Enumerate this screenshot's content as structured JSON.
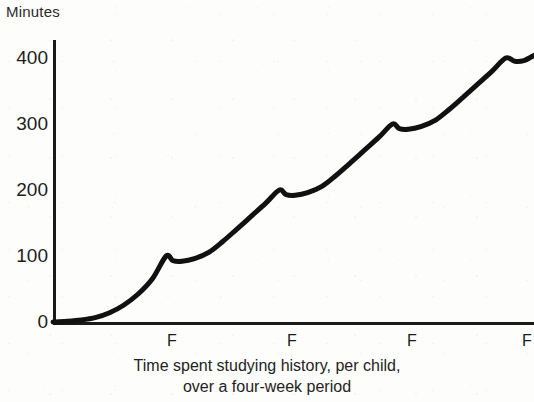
{
  "chart_data": {
    "type": "line",
    "title": "",
    "caption_line_1": "Time spent studying history, per child,",
    "caption_line_2": "over a four-week period",
    "ylabel": "Minutes",
    "xlabel": "",
    "yticks": [
      0,
      100,
      200,
      300,
      400
    ],
    "ytick_labels": [
      "0",
      "100",
      "200",
      "300",
      "400"
    ],
    "ylim": [
      0,
      420
    ],
    "xlim": [
      0,
      4.25
    ],
    "xtick_labels": [
      "F",
      "F",
      "F",
      "F"
    ],
    "xtick_positions": [
      1,
      2,
      3,
      4
    ],
    "grid": false,
    "legend": null,
    "series": [
      {
        "name": "Cumulative study time",
        "description": "Sawtooth forgetting/relearning curve: each week ramps convexly up to a peak at the F marker, then dips slightly and flattens before the next rise.",
        "peaks": [
          100,
          200,
          300,
          400
        ],
        "x": [
          0.0,
          0.12,
          0.25,
          0.38,
          0.5,
          0.62,
          0.75,
          0.88,
          1.0,
          1.06,
          1.14,
          1.25,
          1.38,
          1.5,
          1.62,
          1.75,
          1.88,
          2.0,
          2.06,
          2.14,
          2.25,
          2.38,
          2.5,
          2.62,
          2.75,
          2.88,
          3.0,
          3.06,
          3.14,
          3.25,
          3.38,
          3.5,
          3.62,
          3.75,
          3.88,
          4.0,
          4.08,
          4.16,
          4.25
        ],
        "y": [
          0,
          1,
          3,
          7,
          14,
          25,
          42,
          66,
          100,
          93,
          92,
          96,
          106,
          122,
          140,
          160,
          180,
          200,
          193,
          192,
          196,
          206,
          222,
          240,
          260,
          280,
          300,
          293,
          292,
          296,
          306,
          322,
          340,
          360,
          380,
          400,
          395,
          396,
          404
        ]
      }
    ],
    "colors": {
      "line": "#111111",
      "axis": "#1a1a1a",
      "background": "#fdfdfc",
      "text": "#1d1d1d"
    },
    "geometry": {
      "plot_left": 53,
      "plot_right": 534,
      "plot_top": 40,
      "baseline_y": 322,
      "y_value_400": 58,
      "line_width": 5
    }
  }
}
